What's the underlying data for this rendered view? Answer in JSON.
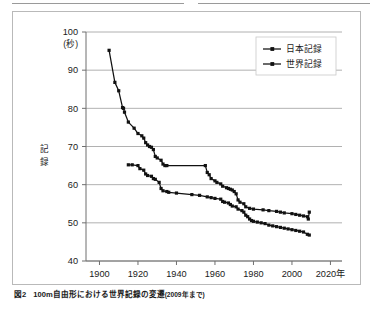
{
  "figure": {
    "caption_number": "図2",
    "caption_text": "100m自由形における世界記録の変遷",
    "caption_note": "(2009年まで)"
  },
  "chart_data": {
    "type": "line",
    "title": "",
    "xlabel": "年",
    "ylabel": "記録",
    "yunit": "(秒)",
    "xlim": [
      1893,
      2026
    ],
    "ylim": [
      40,
      100
    ],
    "xticks": [
      1900,
      1920,
      1940,
      1960,
      1980,
      2000,
      2020
    ],
    "xticklabels": [
      "1900",
      "1920",
      "1940",
      "1960",
      "1980",
      "2000",
      "2020年"
    ],
    "yticks": [
      40,
      50,
      60,
      70,
      80,
      90,
      100
    ],
    "yticklabels": [
      "40",
      "50",
      "60",
      "70",
      "80",
      "90",
      "100"
    ],
    "grid": "horizontal",
    "legend_position": "top-right",
    "series": [
      {
        "name": "日本記録",
        "marker": "square",
        "color": "#111111",
        "points": [
          [
            1915,
            65.2
          ],
          [
            1917,
            65.2
          ],
          [
            1920,
            65.0
          ],
          [
            1921,
            64.2
          ],
          [
            1923,
            63.8
          ],
          [
            1924,
            62.8
          ],
          [
            1925,
            62.4
          ],
          [
            1927,
            62.2
          ],
          [
            1928,
            61.6
          ],
          [
            1929,
            61.4
          ],
          [
            1931,
            60.6
          ],
          [
            1932,
            59.0
          ],
          [
            1933,
            58.4
          ],
          [
            1935,
            58.2
          ],
          [
            1936,
            58.0
          ],
          [
            1940,
            57.8
          ],
          [
            1948,
            57.4
          ],
          [
            1952,
            57.2
          ],
          [
            1956,
            56.8
          ],
          [
            1958,
            56.6
          ],
          [
            1960,
            56.4
          ],
          [
            1963,
            56.2
          ],
          [
            1964,
            55.6
          ],
          [
            1965,
            55.4
          ],
          [
            1967,
            55.2
          ],
          [
            1968,
            54.8
          ],
          [
            1969,
            54.4
          ],
          [
            1971,
            54.2
          ],
          [
            1972,
            53.6
          ],
          [
            1974,
            53.2
          ],
          [
            1975,
            52.8
          ],
          [
            1976,
            52.0
          ],
          [
            1977,
            51.6
          ],
          [
            1978,
            51.0
          ],
          [
            1979,
            50.6
          ],
          [
            1980,
            50.4
          ],
          [
            1982,
            50.2
          ],
          [
            1984,
            50.0
          ],
          [
            1986,
            49.8
          ],
          [
            1988,
            49.4
          ],
          [
            1990,
            49.2
          ],
          [
            1992,
            49.0
          ],
          [
            1994,
            48.8
          ],
          [
            1996,
            48.6
          ],
          [
            1998,
            48.4
          ],
          [
            2000,
            48.2
          ],
          [
            2002,
            48.0
          ],
          [
            2004,
            47.8
          ],
          [
            2006,
            47.6
          ],
          [
            2008,
            47.0
          ],
          [
            2009,
            46.8
          ]
        ]
      },
      {
        "name": "世界記録",
        "marker": "square",
        "color": "#111111",
        "points": [
          [
            1905,
            95.2
          ],
          [
            1908,
            86.8
          ],
          [
            1910,
            84.6
          ],
          [
            1912,
            80.2
          ],
          [
            1912.5,
            80.0
          ],
          [
            1913,
            79.0
          ],
          [
            1915,
            76.4
          ],
          [
            1918,
            74.8
          ],
          [
            1920,
            73.4
          ],
          [
            1922,
            72.8
          ],
          [
            1923,
            72.2
          ],
          [
            1924,
            71.0
          ],
          [
            1925,
            70.4
          ],
          [
            1926,
            70.0
          ],
          [
            1927,
            69.8
          ],
          [
            1928,
            69.2
          ],
          [
            1929,
            67.4
          ],
          [
            1930,
            67.0
          ],
          [
            1932,
            66.4
          ],
          [
            1933,
            65.4
          ],
          [
            1934,
            65.0
          ],
          [
            1935,
            65.0
          ],
          [
            1955,
            65.0
          ],
          [
            1956,
            63.2
          ],
          [
            1957,
            62.6
          ],
          [
            1958,
            61.6
          ],
          [
            1960,
            61.0
          ],
          [
            1961,
            60.6
          ],
          [
            1963,
            60.2
          ],
          [
            1964,
            59.6
          ],
          [
            1966,
            59.2
          ],
          [
            1967,
            59.0
          ],
          [
            1968,
            58.8
          ],
          [
            1969,
            58.6
          ],
          [
            1970,
            58.2
          ],
          [
            1971,
            57.6
          ],
          [
            1972,
            56.0
          ],
          [
            1973,
            55.4
          ],
          [
            1975,
            55.0
          ],
          [
            1976,
            54.2
          ],
          [
            1978,
            53.8
          ],
          [
            1980,
            53.6
          ],
          [
            1985,
            53.4
          ],
          [
            1988,
            53.2
          ],
          [
            1992,
            53.0
          ],
          [
            1994,
            52.8
          ],
          [
            1996,
            52.6
          ],
          [
            2000,
            52.4
          ],
          [
            2002,
            52.2
          ],
          [
            2004,
            52.0
          ],
          [
            2006,
            51.8
          ],
          [
            2008,
            51.6
          ],
          [
            2008.5,
            51.0
          ],
          [
            2009,
            52.8
          ]
        ]
      }
    ]
  }
}
